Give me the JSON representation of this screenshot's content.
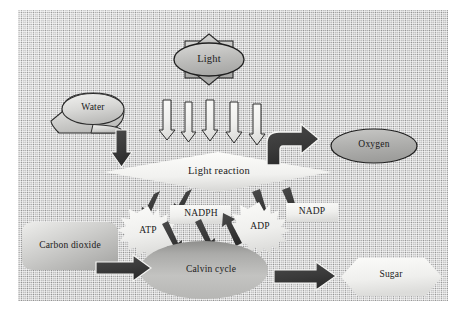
{
  "figure": {
    "kind": "photosynthesis-flow-diagram",
    "background_color": "#c5c5c5",
    "shape_fill_light": "#f0f0ee",
    "shape_fill_gray": "#b2b2b2",
    "outline_color": "#2b2b2b",
    "arrow_dark": "#3a3a3a",
    "arrow_light": "#f2f2f0",
    "text_color": "#1a1a1a"
  },
  "nodes": {
    "light": {
      "label": "Light",
      "shape": "sun-burst-ellipse"
    },
    "water": {
      "label": "Water",
      "shape": "ellipse"
    },
    "light_reaction": {
      "label": "Light reaction",
      "shape": "diamond"
    },
    "oxygen": {
      "label": "Oxygen",
      "shape": "ellipse"
    },
    "carbon_dioxide": {
      "label": "Carbon dioxide",
      "shape": "rounded-rectangle"
    },
    "calvin_cycle": {
      "label": "Calvin cycle",
      "shape": "ellipse"
    },
    "sugar": {
      "label": "Sugar",
      "shape": "hexagon"
    },
    "atp": {
      "label": "ATP",
      "shape": "explosion-star"
    },
    "adp": {
      "label": "ADP",
      "shape": "explosion-star"
    },
    "nadph": {
      "label": "NADPH",
      "shape": "rectangle"
    },
    "nadp": {
      "label": "NADP",
      "shape": "rectangle"
    }
  },
  "connectors": [
    {
      "name": "light-to-light-reaction-1",
      "style": "light-down-arrow"
    },
    {
      "name": "light-to-light-reaction-2",
      "style": "light-down-arrow"
    },
    {
      "name": "light-to-light-reaction-3",
      "style": "light-down-arrow"
    },
    {
      "name": "light-to-light-reaction-4",
      "style": "light-down-arrow"
    },
    {
      "name": "light-to-light-reaction-5",
      "style": "light-down-arrow"
    },
    {
      "name": "water-to-light-reaction",
      "style": "dark-down-arrow"
    },
    {
      "name": "light-reaction-to-oxygen",
      "style": "dark-elbow-arrow-right"
    },
    {
      "name": "light-reaction-to-atp",
      "style": "dark-diagonal-arrow-down-left"
    },
    {
      "name": "light-reaction-to-nadph",
      "style": "dark-diagonal-arrow-down-left"
    },
    {
      "name": "adp-to-light-reaction",
      "style": "dark-diagonal-arrow-up-right"
    },
    {
      "name": "nadp-to-light-reaction",
      "style": "dark-diagonal-arrow-up-right"
    },
    {
      "name": "atp-to-calvin-cycle",
      "style": "dark-diagonal-arrow-down-right"
    },
    {
      "name": "nadph-to-calvin-cycle",
      "style": "dark-diagonal-arrow-down-right"
    },
    {
      "name": "calvin-cycle-to-adp",
      "style": "dark-diagonal-arrow-up-right"
    },
    {
      "name": "carbon-dioxide-to-calvin-cycle",
      "style": "dark-right-arrow"
    },
    {
      "name": "calvin-cycle-to-sugar",
      "style": "dark-right-arrow"
    }
  ]
}
